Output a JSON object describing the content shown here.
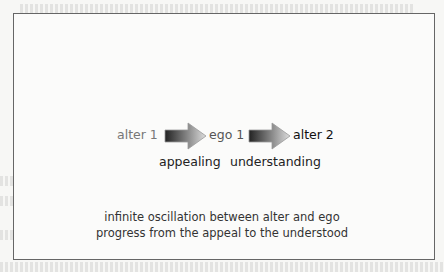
{
  "diagram": {
    "nodes": [
      {
        "label": "alter 1",
        "color": "#777777"
      },
      {
        "label": "ego 1",
        "color": "#555555"
      },
      {
        "label": "alter 2",
        "color": "#111111"
      }
    ],
    "edges": [
      {
        "from": "alter 1",
        "to": "ego 1",
        "label": "appealing"
      },
      {
        "from": "ego 1",
        "to": "alter 2",
        "label": "understanding"
      }
    ],
    "caption": {
      "line1": "infinite oscillation between alter and ego",
      "line2": "progress from the appeal to the understood"
    }
  }
}
